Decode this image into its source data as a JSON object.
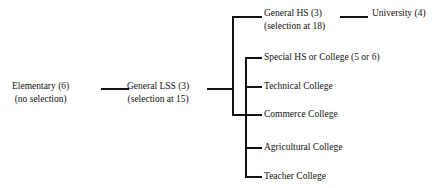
{
  "diagram": {
    "line_color": "#111111",
    "background": "#ffffff",
    "nodes": {
      "elementary": {
        "label": "Elementary (6)",
        "sublabel": "(no selection)"
      },
      "general_lss": {
        "label": "General LSS (3)",
        "sublabel": "(selection at 15)"
      },
      "general_hs": {
        "label": "General HS (3)",
        "sublabel": "(selection at 18)"
      },
      "university": {
        "label": "University (4)"
      }
    },
    "branches": [
      {
        "label": "General HS (3)",
        "y": 16
      },
      {
        "label": "Special HS or College (5 or 6)",
        "y": 57
      },
      {
        "label": "Technical College",
        "y": 86
      },
      {
        "label": "Commerce College",
        "y": 114
      },
      {
        "label": "Agricultural College",
        "y": 147
      },
      {
        "label": "Teacher College",
        "y": 176
      }
    ]
  }
}
